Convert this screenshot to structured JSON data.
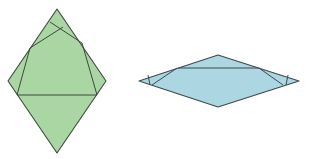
{
  "caption": "",
  "figures": [
    {
      "name": "green-folded-rhombus",
      "fill": "#a9d6a2",
      "stroke": "#3d4a3d",
      "outline": [
        [
          57,
          9
        ],
        [
          106,
          81
        ],
        [
          57,
          153
        ],
        [
          8,
          81
        ]
      ],
      "fold_lines": [
        [
          [
            17,
            95
          ],
          [
            97,
            95
          ]
        ],
        [
          [
            30,
            48
          ],
          [
            63,
            27
          ]
        ],
        [
          [
            50,
            22
          ],
          [
            82,
            43
          ]
        ],
        [
          [
            82,
            43
          ],
          [
            97,
            95
          ]
        ],
        [
          [
            30,
            48
          ],
          [
            17,
            95
          ]
        ]
      ]
    },
    {
      "name": "blue-folded-rhombus",
      "fill": "#abd6e2",
      "stroke": "#3d4a4d",
      "outline": [
        [
          218,
          55
        ],
        [
          299,
          81
        ],
        [
          218,
          107
        ],
        [
          139,
          81
        ]
      ],
      "fold_lines": [
        [
          [
            178,
            68
          ],
          [
            259,
            68
          ]
        ],
        [
          [
            177,
            68
          ],
          [
            152,
            85
          ]
        ],
        [
          [
            148,
            75
          ],
          [
            150,
            85
          ]
        ],
        [
          [
            259,
            68
          ],
          [
            283,
            85
          ]
        ],
        [
          [
            288,
            75
          ],
          [
            286,
            85
          ]
        ]
      ]
    }
  ]
}
